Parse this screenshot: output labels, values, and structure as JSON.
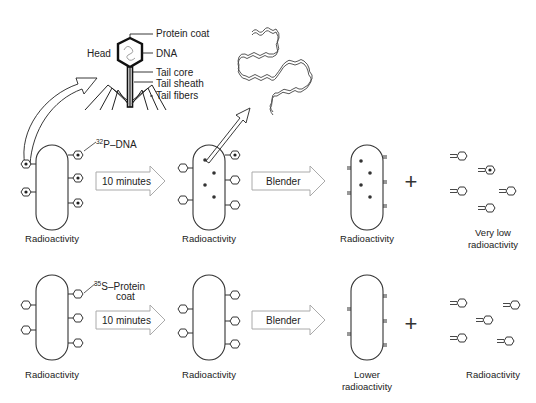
{
  "phage_diagram": {
    "labels": {
      "head": "Head",
      "protein_coat": "Protein coat",
      "dna": "DNA",
      "tail_core": "Tail core",
      "tail_sheath": "Tail sheath",
      "tail_fibers": "Tail fibers"
    }
  },
  "experiment_1": {
    "label_marker": "32",
    "label_marker_text": "P–DNA",
    "step1_arrow": "10 minutes",
    "step2_arrow": "Blender",
    "captions": {
      "cell_start": "Radioactivity",
      "cell_infected": "Radioactivity",
      "cell_blended": "Radioactivity",
      "plus": "+",
      "ghosts_line1": "Very low",
      "ghosts_line2": "radioactivity"
    }
  },
  "experiment_2": {
    "label_marker": "35",
    "label_marker_text": "S–Protein",
    "label_marker_text2": "coat",
    "step1_arrow": "10 minutes",
    "step2_arrow": "Blender",
    "captions": {
      "cell_start": "Radioactivity",
      "cell_infected": "Radioactivity",
      "cell_blended_line1": "Lower",
      "cell_blended_line2": "radioactivity",
      "plus": "+",
      "ghosts": "Radioactivity"
    }
  }
}
